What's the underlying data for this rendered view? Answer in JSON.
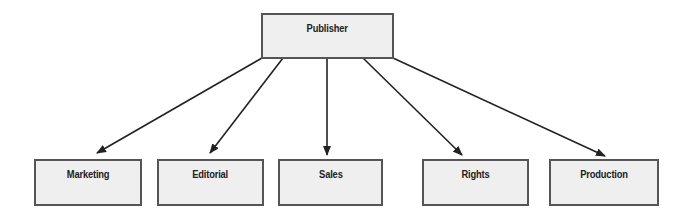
{
  "diagram": {
    "type": "org-chart",
    "root": {
      "id": "publisher",
      "label": "Publisher"
    },
    "children": [
      {
        "id": "marketing",
        "label": "Marketing"
      },
      {
        "id": "editorial",
        "label": "Editorial"
      },
      {
        "id": "sales",
        "label": "Sales"
      },
      {
        "id": "rights",
        "label": "Rights"
      },
      {
        "id": "production",
        "label": "Production"
      }
    ],
    "edges": [
      {
        "from": "publisher",
        "to": "marketing"
      },
      {
        "from": "publisher",
        "to": "editorial"
      },
      {
        "from": "publisher",
        "to": "sales"
      },
      {
        "from": "publisher",
        "to": "rights"
      },
      {
        "from": "publisher",
        "to": "production"
      }
    ],
    "colors": {
      "box_fill": "#efefef",
      "box_border": "#555555",
      "arrow": "#222222",
      "text": "#222222"
    }
  }
}
